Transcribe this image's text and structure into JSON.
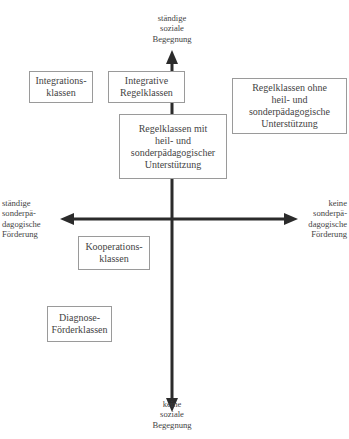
{
  "axes": {
    "top_label": "ständige\nsoziale\nBegegnung",
    "bottom_label": "keine\nsoziale\nBegegnung",
    "left_label": "ständige\nsonderpä-\ndagogische\nFörderung",
    "right_label": "keine\nsonderpä-\ndagogische\nFörderung",
    "color": "#2b2b2b"
  },
  "boxes": [
    {
      "id": "integrationsklassen",
      "label": "Integrations-\nklassen"
    },
    {
      "id": "integrative-regelklassen",
      "label": "Integrative\nRegelklassen"
    },
    {
      "id": "regelklassen-mit",
      "label": "Regelklassen mit\nheil- und\nsonderpädagogischer\nUnterstützung"
    },
    {
      "id": "regelklassen-ohne",
      "label": "Regelklassen ohne\nheil- und\nsonderpädagogische\nUnterstützung"
    },
    {
      "id": "kooperationsklassen",
      "label": "Kooperations-\nklassen"
    },
    {
      "id": "diagnose-foerderklassen",
      "label": "Diagnose-\nFörderklassen"
    }
  ]
}
